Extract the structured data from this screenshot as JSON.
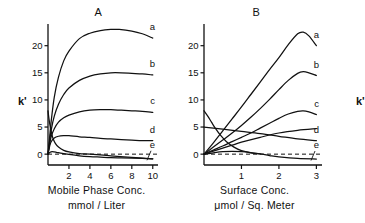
{
  "figure": {
    "ylabel": "k'",
    "curve_labels": [
      "a",
      "b",
      "c",
      "d",
      "e"
    ]
  },
  "panelA": {
    "title": "A",
    "xlabel_line1": "Mobile Phase Conc.",
    "xlabel_line2": "mmol / Liter",
    "ylabel": "k'",
    "xticks": [
      "2",
      "4",
      "6",
      "8",
      "10"
    ],
    "yticks": [
      "0",
      "5",
      "10",
      "15",
      "20"
    ]
  },
  "panelB": {
    "title": "B",
    "xlabel_line1": "Surface Conc.",
    "xlabel_line2": "μmol / Sq. Meter",
    "ylabel": "k'",
    "xticks": [
      "1",
      "2",
      "3"
    ],
    "yticks": [
      "0",
      "5",
      "10",
      "15",
      "20"
    ]
  },
  "chart_data": [
    {
      "type": "line",
      "panel": "A",
      "title": "A",
      "xlabel": "Mobile Phase Conc. mmol / Liter",
      "ylabel": "k'",
      "xlim": [
        0,
        10.5
      ],
      "ylim": [
        -2,
        24
      ],
      "xticks": [
        2,
        4,
        6,
        8,
        10
      ],
      "yticks": [
        0,
        5,
        10,
        15,
        20
      ],
      "grid": false,
      "zero_reference_line": 0,
      "zero_line_style": "dashed",
      "legend": "inline-right-labels",
      "series": [
        {
          "name": "a",
          "x": [
            0,
            0.15,
            0.3,
            0.6,
            1.0,
            1.5,
            2.0,
            3.0,
            4.0,
            5.0,
            6.0,
            6.8,
            8.0,
            9.0,
            10.0
          ],
          "y": [
            0,
            3.0,
            6.0,
            10.5,
            14.2,
            17.2,
            19.0,
            21.3,
            22.3,
            22.8,
            23.0,
            23.0,
            22.7,
            22.2,
            21.4
          ]
        },
        {
          "name": "b",
          "x": [
            0,
            0.15,
            0.3,
            0.6,
            1.0,
            1.5,
            2.0,
            3.0,
            4.0,
            5.0,
            6.0,
            7.0,
            8.0,
            9.0,
            10.0
          ],
          "y": [
            0,
            2.3,
            4.4,
            7.0,
            9.2,
            11.0,
            12.2,
            13.6,
            14.4,
            14.8,
            15.0,
            15.0,
            14.9,
            14.8,
            14.6
          ]
        },
        {
          "name": "c",
          "x": [
            0,
            0.15,
            0.3,
            0.6,
            1.0,
            1.5,
            2.0,
            3.0,
            4.0,
            5.0,
            6.0,
            7.0,
            8.0,
            9.0,
            10.0
          ],
          "y": [
            0,
            1.8,
            3.2,
            4.7,
            5.9,
            6.7,
            7.2,
            7.8,
            8.1,
            8.2,
            8.2,
            8.1,
            8.0,
            7.9,
            7.7
          ]
        },
        {
          "name": "d",
          "x": [
            0,
            0.15,
            0.3,
            0.6,
            1.0,
            1.5,
            2.0,
            3.0,
            4.0,
            5.0,
            6.0,
            7.0,
            8.0,
            9.0,
            10.0
          ],
          "y": [
            0,
            1.4,
            2.3,
            3.0,
            3.3,
            3.4,
            3.4,
            3.2,
            3.1,
            2.9,
            2.8,
            2.7,
            2.6,
            2.5,
            2.5
          ]
        },
        {
          "name": "e",
          "x": [
            0,
            0.2,
            0.4,
            0.8,
            1.2,
            2.0,
            3.0,
            4.0,
            5.0,
            6.0,
            7.0,
            8.0,
            9.0,
            10.0
          ],
          "y": [
            0,
            0.35,
            0.45,
            0.35,
            0.2,
            -0.05,
            -0.3,
            -0.45,
            -0.55,
            -0.65,
            -0.7,
            -0.75,
            -0.8,
            -0.85
          ]
        },
        {
          "name": "descending",
          "x": [
            0,
            0.1,
            0.2,
            0.35,
            0.5,
            0.7,
            1.0,
            1.5,
            2.0,
            3.0,
            4.0,
            6.0,
            8.0,
            10.0
          ],
          "y": [
            8.0,
            6.4,
            5.2,
            3.8,
            2.8,
            2.0,
            1.3,
            0.7,
            0.4,
            0.1,
            0.0,
            -0.3,
            -0.6,
            -0.85
          ]
        }
      ]
    },
    {
      "type": "line",
      "panel": "B",
      "title": "B",
      "xlabel": "Surface Conc. μmol / Sq. Meter",
      "ylabel": "k'",
      "xlim": [
        0,
        3.15
      ],
      "ylim": [
        -2,
        24
      ],
      "xticks": [
        1,
        2,
        3
      ],
      "yticks": [
        0,
        5,
        10,
        15,
        20
      ],
      "grid": false,
      "zero_reference_line": 0,
      "zero_line_style": "dashed",
      "legend": "inline-right-labels",
      "series": [
        {
          "name": "a",
          "x": [
            0,
            0.25,
            0.5,
            0.75,
            1.0,
            1.25,
            1.5,
            1.75,
            2.0,
            2.25,
            2.5,
            2.65,
            2.8,
            3.0
          ],
          "y": [
            0,
            2.1,
            4.3,
            6.5,
            8.7,
            11.0,
            13.3,
            15.6,
            17.8,
            20.2,
            22.2,
            22.5,
            21.8,
            20.0
          ]
        },
        {
          "name": "b",
          "x": [
            0,
            0.25,
            0.5,
            0.75,
            1.0,
            1.25,
            1.5,
            1.75,
            2.0,
            2.25,
            2.5,
            2.65,
            2.8,
            3.0
          ],
          "y": [
            0,
            1.3,
            2.6,
            3.9,
            5.3,
            6.8,
            8.4,
            10.1,
            11.9,
            13.6,
            14.9,
            15.2,
            15.0,
            14.5
          ]
        },
        {
          "name": "c",
          "x": [
            0,
            0.25,
            0.5,
            0.75,
            1.0,
            1.25,
            1.5,
            1.75,
            2.0,
            2.25,
            2.5,
            2.65,
            2.8,
            3.0
          ],
          "y": [
            0,
            0.75,
            1.5,
            2.3,
            3.1,
            3.9,
            4.8,
            5.7,
            6.6,
            7.4,
            7.9,
            8.0,
            7.8,
            7.3
          ]
        },
        {
          "name": "d",
          "x": [
            0,
            0.5,
            1.0,
            1.5,
            2.0,
            2.5,
            3.0
          ],
          "y": [
            5.0,
            4.6,
            4.2,
            3.8,
            3.3,
            2.8,
            2.5
          ]
        },
        {
          "name": "e",
          "x": [
            0,
            0.25,
            0.5,
            0.75,
            1.0,
            1.25,
            1.5,
            1.75,
            2.0,
            2.5,
            3.0
          ],
          "y": [
            0,
            0.25,
            0.45,
            0.5,
            0.45,
            0.3,
            0.05,
            -0.25,
            -0.5,
            -0.8,
            -0.9
          ]
        },
        {
          "name": "ascending-d-partner",
          "x": [
            0,
            0.25,
            0.5,
            0.75,
            1.0,
            1.5,
            2.0,
            2.5,
            3.0
          ],
          "y": [
            0,
            0.55,
            1.1,
            1.65,
            2.2,
            3.1,
            3.9,
            4.4,
            4.7
          ]
        },
        {
          "name": "descending",
          "x": [
            0,
            0.1,
            0.2,
            0.3,
            0.45,
            0.6,
            0.8,
            1.0,
            1.25,
            1.5
          ],
          "y": [
            8.0,
            7.0,
            5.9,
            4.8,
            3.4,
            2.3,
            1.3,
            0.65,
            0.25,
            0.05
          ]
        }
      ]
    }
  ]
}
